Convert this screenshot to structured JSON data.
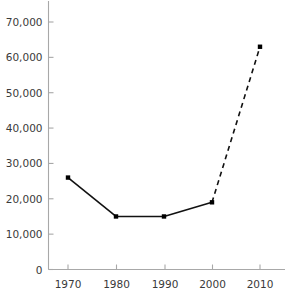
{
  "chart_data": {
    "type": "line",
    "title": "",
    "subtitle": "",
    "xlabel": "",
    "ylabel": "",
    "categories": [
      "1970",
      "1980",
      "1990",
      "2000",
      "2010"
    ],
    "x": [
      1970,
      1980,
      1990,
      2000,
      2010
    ],
    "values": [
      26000,
      15000,
      15000,
      19000,
      63000
    ],
    "series": [
      {
        "name": "",
        "values": [
          26000,
          15000,
          15000,
          19000,
          63000
        ],
        "segment_styles": [
          "solid",
          "solid",
          "solid",
          "dashed"
        ],
        "marker": "square"
      }
    ],
    "ylim": [
      0,
      70000
    ],
    "xlim": [
      1965,
      2015
    ],
    "yticks": [
      0,
      10000,
      20000,
      30000,
      40000,
      50000,
      60000,
      70000
    ],
    "ytick_labels": [
      "0",
      "10,000",
      "20,000",
      "30,000",
      "40,000",
      "50,000",
      "60,000",
      "70,000"
    ],
    "xticks": [
      1970,
      1980,
      1990,
      2000,
      2010
    ],
    "xtick_labels": [
      "1970",
      "1980",
      "1990",
      "2000",
      "2010"
    ],
    "grid": false,
    "legend": null,
    "annotations": [],
    "colors": {
      "line": "#111111",
      "marker": "#000000",
      "axis": "#a8a8a8",
      "tick_text": "#3a3a3a",
      "background": "#ffffff"
    }
  }
}
